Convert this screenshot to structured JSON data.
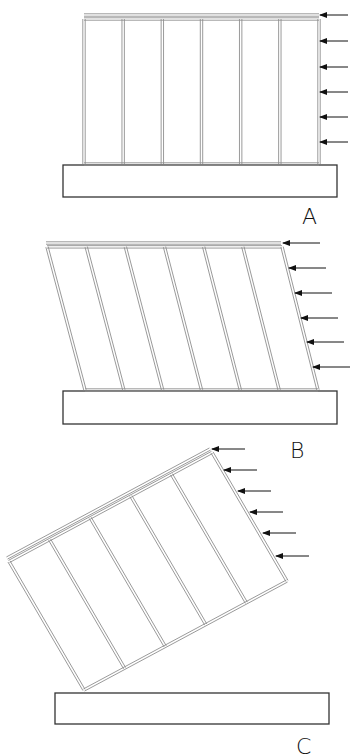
{
  "diagram": {
    "colors": {
      "stud_stroke": "#8f8f8f",
      "foundation_stroke": "#333333",
      "arrow": "#111111",
      "background": "#ffffff"
    },
    "panels": [
      {
        "id": "A",
        "label": "A",
        "label_pos": [
          302,
          206
        ],
        "state": "standing",
        "foundation": {
          "x": 63,
          "y": 165,
          "w": 274,
          "h": 32
        },
        "wall": {
          "top_left": [
            84,
            15
          ],
          "top_right": [
            319,
            15
          ],
          "bottom_left": [
            84,
            164
          ],
          "bottom_right": [
            319,
            164
          ]
        },
        "studs": 7,
        "arrows": [
          {
            "x1": 348,
            "x2": 320,
            "y": 15
          },
          {
            "x1": 348,
            "x2": 320,
            "y": 41
          },
          {
            "x1": 348,
            "x2": 320,
            "y": 67
          },
          {
            "x1": 348,
            "x2": 320,
            "y": 92
          },
          {
            "x1": 348,
            "x2": 320,
            "y": 117
          },
          {
            "x1": 348,
            "x2": 320,
            "y": 142
          }
        ]
      },
      {
        "id": "B",
        "label": "B",
        "label_pos": [
          290,
          440
        ],
        "state": "racking",
        "foundation": {
          "x": 63,
          "y": 391,
          "w": 274,
          "h": 33
        },
        "wall": {
          "top_left": [
            46,
            243
          ],
          "top_right": [
            281,
            243
          ],
          "bottom_left": [
            85,
            390
          ],
          "bottom_right": [
            318,
            390
          ]
        },
        "studs": 7,
        "arrows": [
          {
            "x1": 320,
            "x2": 283,
            "y": 243
          },
          {
            "x1": 326,
            "x2": 289,
            "y": 268
          },
          {
            "x1": 332,
            "x2": 295,
            "y": 293
          },
          {
            "x1": 338,
            "x2": 301,
            "y": 318
          },
          {
            "x1": 344,
            "x2": 307,
            "y": 342
          },
          {
            "x1": 350,
            "x2": 313,
            "y": 367
          }
        ]
      },
      {
        "id": "C",
        "label": "C",
        "label_pos": [
          296,
          736
        ],
        "state": "overturning",
        "foundation": {
          "x": 55,
          "y": 693,
          "w": 274,
          "h": 31
        },
        "wall": {
          "top_left": [
            7,
            558
          ],
          "top_right": [
            210,
            449
          ],
          "bottom_left": [
            84,
            690
          ],
          "bottom_right": [
            287,
            581
          ]
        },
        "studs": 6,
        "arrows": [
          {
            "x1": 245,
            "x2": 212,
            "y": 449
          },
          {
            "x1": 257,
            "x2": 224,
            "y": 470
          },
          {
            "x1": 271,
            "x2": 238,
            "y": 491
          },
          {
            "x1": 283,
            "x2": 250,
            "y": 512
          },
          {
            "x1": 296,
            "x2": 263,
            "y": 533
          },
          {
            "x1": 309,
            "x2": 276,
            "y": 556
          }
        ]
      }
    ]
  }
}
